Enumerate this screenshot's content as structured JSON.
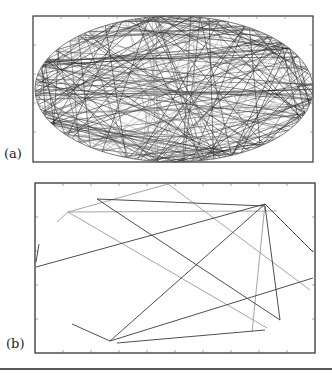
{
  "figure": {
    "panels": [
      {
        "id": "a",
        "label": "(a)",
        "description": "Dense chaotic billiard trajectory inside an elliptical boundary"
      },
      {
        "id": "b",
        "label": "(b)",
        "description": "Sparse straight-line trajectory segments bouncing in a rectangular domain"
      }
    ],
    "colors": {
      "frame": "#333333",
      "dark_line": "#3a3a3a",
      "light_line": "#9a9a9a",
      "rule": "#222222"
    }
  }
}
